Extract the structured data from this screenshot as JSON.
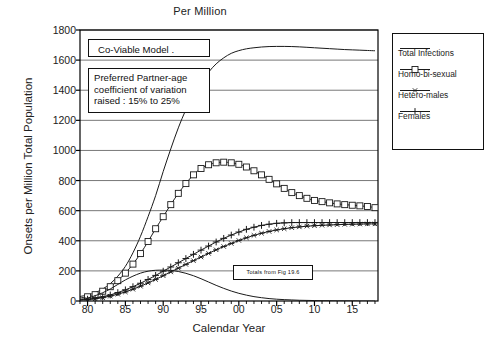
{
  "chart_data": {
    "type": "line",
    "title": "Per Million",
    "xlabel": "Calendar Year",
    "ylabel": "Onsets per Million Total Population",
    "xlim": [
      1979,
      1918
    ],
    "ylim": [
      0,
      1800
    ],
    "grid": true,
    "legend_position": "right-outside",
    "x_tick_labels": [
      "80",
      "85",
      "90",
      "95",
      "00",
      "05",
      "10",
      "15"
    ],
    "x_tick_values": [
      1980,
      1985,
      1990,
      1995,
      2000,
      2005,
      2010,
      2015
    ],
    "x_minor_tick_interval": 1,
    "y_tick_labels": [
      "0",
      "200",
      "400",
      "600",
      "800",
      "1000",
      "1200",
      "1400",
      "1600",
      "1800"
    ],
    "y_tick_values": [
      0,
      200,
      400,
      600,
      800,
      1000,
      1200,
      1400,
      1600,
      1800
    ],
    "x": [
      1979,
      1980,
      1981,
      1982,
      1983,
      1984,
      1985,
      1986,
      1987,
      1988,
      1989,
      1990,
      1991,
      1992,
      1993,
      1994,
      1995,
      1996,
      1997,
      1998,
      1999,
      2000,
      2001,
      2002,
      2003,
      2004,
      2005,
      2006,
      2007,
      2008,
      2009,
      2010,
      2011,
      2012,
      2013,
      2014,
      2015,
      2016,
      2017,
      2018
    ],
    "series": [
      {
        "name": "Total Infections",
        "marker": "none",
        "values": [
          30,
          40,
          55,
          80,
          115,
          165,
          230,
          320,
          430,
          560,
          700,
          860,
          1010,
          1150,
          1270,
          1370,
          1450,
          1520,
          1575,
          1615,
          1645,
          1663,
          1675,
          1682,
          1687,
          1690,
          1691,
          1691,
          1690,
          1688,
          1685,
          1682,
          1679,
          1676,
          1673,
          1670,
          1668,
          1666,
          1664,
          1662
        ]
      },
      {
        "name": "Homo-bi-sexual",
        "marker": "square",
        "values": [
          20,
          28,
          42,
          65,
          95,
          135,
          185,
          245,
          315,
          395,
          480,
          560,
          640,
          715,
          780,
          838,
          880,
          905,
          918,
          922,
          918,
          908,
          890,
          865,
          838,
          808,
          778,
          748,
          720,
          700,
          682,
          668,
          660,
          652,
          645,
          640,
          636,
          632,
          628,
          620
        ]
      },
      {
        "name": "Hetero-males",
        "marker": "asterisk",
        "values": [
          6,
          9,
          14,
          22,
          32,
          45,
          60,
          78,
          98,
          120,
          143,
          168,
          193,
          218,
          243,
          268,
          292,
          316,
          340,
          362,
          382,
          402,
          420,
          436,
          450,
          462,
          472,
          480,
          487,
          492,
          497,
          500,
          503,
          505,
          507,
          509,
          510,
          511,
          512,
          512
        ]
      },
      {
        "name": "Females",
        "marker": "plus",
        "values": [
          8,
          12,
          18,
          28,
          40,
          56,
          74,
          95,
          118,
          143,
          170,
          198,
          226,
          254,
          282,
          310,
          338,
          365,
          392,
          416,
          438,
          458,
          476,
          490,
          502,
          510,
          516,
          519,
          521,
          521,
          521,
          521,
          521,
          521,
          521,
          521,
          521,
          521,
          521,
          521
        ]
      },
      {
        "name": "Totals from Fig 19.6",
        "marker": "none",
        "values": [
          10,
          20,
          35,
          55,
          80,
          110,
          140,
          165,
          185,
          198,
          204,
          205,
          203,
          196,
          184,
          168,
          148,
          126,
          104,
          84,
          66,
          51,
          39,
          29,
          22,
          16,
          12,
          9,
          7,
          5,
          4,
          3,
          2,
          2,
          1,
          1,
          1,
          0,
          0,
          0
        ]
      }
    ],
    "annotations": [
      {
        "id": "model",
        "text": "Co-Viable  Model ."
      },
      {
        "id": "partner",
        "line1": "Preferred Partner-age",
        "line2": "coefficient of variation",
        "line3": "raised  : 15% to 25%"
      },
      {
        "id": "totals",
        "text": "Totals  from  Fig 19.6"
      }
    ],
    "legend": [
      {
        "label": "Total Infections",
        "marker": "none"
      },
      {
        "label": "Homo-bi-sexual",
        "marker": "square"
      },
      {
        "label": "Hetero-males",
        "marker": "asterisk"
      },
      {
        "label": "Females",
        "marker": "plus"
      }
    ],
    "colors": {
      "line": "#1a1a1a",
      "grid": "#555555",
      "axis": "#000000",
      "background": "#ffffff"
    }
  }
}
